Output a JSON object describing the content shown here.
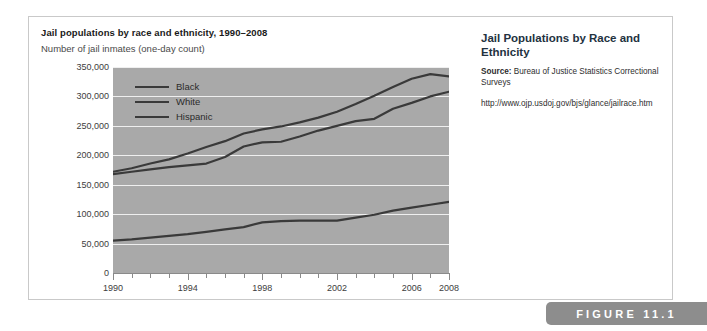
{
  "figure": {
    "tab_label": "FIGURE 11.1"
  },
  "chart": {
    "title": "Jail populations by race and ethnicity, 1990–2008",
    "subtitle": "Number of jail inmates (one-day count)",
    "zero_label": "0"
  },
  "caption": {
    "title": "Jail Populations by Race and Ethnicity",
    "source_label": "Source:",
    "source_text": "Bureau of Justice Statistics Correctional Surveys",
    "url": "http://www.ojp.usdoj.gov/bjs/glance/jailrace.htm"
  },
  "chart_data": {
    "type": "line",
    "title": "Jail populations by race and ethnicity, 1990–2008",
    "xlabel": "",
    "ylabel": "Number of jail inmates (one-day count)",
    "xlim": [
      1990,
      2008
    ],
    "ylim": [
      0,
      350000
    ],
    "yticks": [
      0,
      50000,
      100000,
      150000,
      200000,
      250000,
      300000,
      350000
    ],
    "ytick_labels": [
      "0",
      "50,000",
      "100,000",
      "150,000",
      "200,000",
      "250,000",
      "300,000",
      "350,000"
    ],
    "xticks": [
      1990,
      1991,
      1992,
      1993,
      1994,
      1995,
      1996,
      1997,
      1998,
      1999,
      2000,
      2001,
      2002,
      2003,
      2004,
      2005,
      2006,
      2007,
      2008
    ],
    "xtick_labels_major": [
      "1990",
      "1994",
      "1998",
      "2002",
      "2006",
      "2008"
    ],
    "grid": "horizontal-white",
    "legend_position": "inside-top-left",
    "plot_background": "#a9a9a9",
    "line_color": "#3a3a3a",
    "x": [
      1990,
      1991,
      1992,
      1993,
      1994,
      1995,
      1996,
      1997,
      1998,
      1999,
      2000,
      2001,
      2002,
      2003,
      2004,
      2005,
      2006,
      2007,
      2008
    ],
    "series": [
      {
        "name": "Black",
        "values": [
          172000,
          178000,
          186000,
          193000,
          203000,
          214000,
          224000,
          237000,
          244000,
          249000,
          256000,
          264000,
          274000,
          287000,
          301000,
          316000,
          330000,
          338000,
          334000
        ]
      },
      {
        "name": "White",
        "values": [
          168000,
          172000,
          176000,
          180000,
          183000,
          186000,
          197000,
          215000,
          222000,
          223000,
          232000,
          242000,
          250000,
          258000,
          262000,
          279000,
          289000,
          300000,
          308000
        ]
      },
      {
        "name": "Hispanic",
        "values": [
          55000,
          57000,
          60000,
          63000,
          66000,
          70000,
          74000,
          78000,
          86000,
          88000,
          89000,
          89000,
          89000,
          94000,
          99000,
          106000,
          111000,
          116000,
          121000
        ]
      }
    ]
  }
}
